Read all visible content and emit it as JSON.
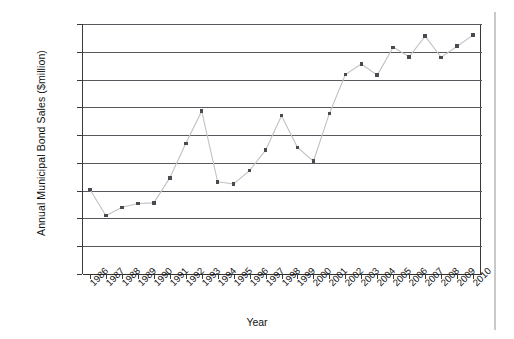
{
  "figure": {
    "background_color": "#ffffff",
    "page_edge_color": "#c9c9c9"
  },
  "chart_data": {
    "type": "line",
    "title": "",
    "xlabel": "Year",
    "ylabel": "Annual Municipal Bond Sales ($million)",
    "x": [
      1986,
      1987,
      1988,
      1989,
      1990,
      1991,
      1992,
      1993,
      1994,
      1995,
      1996,
      1997,
      1998,
      1999,
      2000,
      2001,
      2002,
      2003,
      2004,
      2005,
      2006,
      2007,
      2008,
      2009,
      2010
    ],
    "categories": [
      "1986",
      "1987",
      "1988",
      "1989",
      "1990",
      "1991",
      "1992",
      "1993",
      "1994",
      "1995",
      "1996",
      "1997",
      "1998",
      "1999",
      "2000",
      "2001",
      "2002",
      "2003",
      "2004",
      "2005",
      "2006",
      "2007",
      "2008",
      "2009",
      "2010"
    ],
    "values": [
      152,
      105,
      120,
      127,
      128,
      173,
      235,
      293,
      166,
      162,
      186,
      223,
      285,
      228,
      203,
      289,
      359,
      378,
      358,
      408,
      391,
      428,
      390,
      410,
      430
    ],
    "series": [
      {
        "name": "Annual Municipal Bond Sales",
        "values": [
          152,
          105,
          120,
          127,
          128,
          173,
          235,
          293,
          166,
          162,
          186,
          223,
          285,
          228,
          203,
          289,
          359,
          378,
          358,
          408,
          391,
          428,
          390,
          410,
          430
        ],
        "marker": "square",
        "marker_color": "#4a4a52",
        "line_color": "#c2c2c2"
      }
    ],
    "ylim": [
      0,
      450
    ],
    "yticks": [
      0,
      50,
      100,
      150,
      200,
      250,
      300,
      350,
      400,
      450
    ],
    "ytick_labels": [
      "$0",
      "$50",
      "$100",
      "$150",
      "$200",
      "$250",
      "$300",
      "$350",
      "$400",
      "$450"
    ],
    "xtick_labels": [
      "1986",
      "1987",
      "1988",
      "1989",
      "1990",
      "1991",
      "1992",
      "1993",
      "1994",
      "1995",
      "1996",
      "1997",
      "1998",
      "1999",
      "2000",
      "2001",
      "2002",
      "2003",
      "2004",
      "2005",
      "2006",
      "2007",
      "2008",
      "2009",
      "2010"
    ],
    "xtick_rotation": -45,
    "grid": true,
    "grid_axis": "y",
    "grid_color": "#55585c",
    "legend": false,
    "legend_position": "none"
  }
}
